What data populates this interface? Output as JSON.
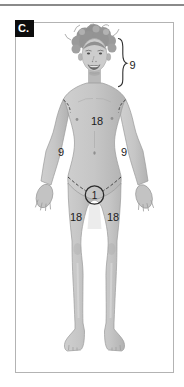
{
  "panel": {
    "label": "C."
  },
  "figure": {
    "labels": {
      "head": "9",
      "trunk": "18",
      "left_arm": "9",
      "right_arm": "9",
      "perineum": "1",
      "left_thigh": "18",
      "right_thigh": "18"
    },
    "colors": {
      "annotation_text": "#1c1c1c",
      "panel_border": "#b3b3b3",
      "panel_label_bg": "#0d0d0d",
      "panel_label_text": "#ffffff",
      "top_rule": "#8a8a8a",
      "skin_tone": "#c6c6c6",
      "hair_tone": "#969696"
    }
  }
}
